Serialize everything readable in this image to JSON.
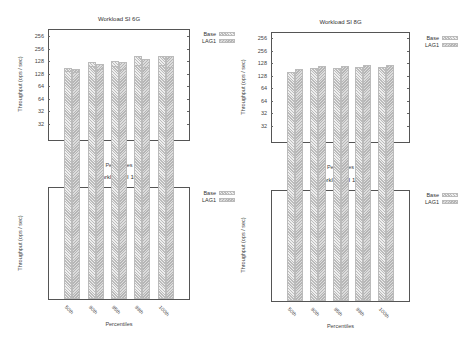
{
  "figure": {
    "ylabel": "Throughput (ops / sec)",
    "xlabel": "Percentiles",
    "legend": [
      "Base",
      "LAG1"
    ],
    "yticks": [
      256,
      128,
      64,
      32
    ],
    "categories": [
      "50th",
      "90th",
      "95th",
      "99th",
      "100th"
    ]
  },
  "chart_data": [
    {
      "type": "bar",
      "title": "Workload SI 6G",
      "xlabel": "Percentiles",
      "ylabel": "Throughput (ops / sec)",
      "yscale": "log2",
      "yticks": [
        32,
        64,
        128,
        256
      ],
      "categories": [
        "50th",
        "90th",
        "95th",
        "99th",
        "100th"
      ],
      "series": [
        {
          "name": "Base",
          "values": [
            151,
            180,
            184,
            210,
            211
          ]
        },
        {
          "name": "LAG1",
          "values": [
            147,
            169,
            179,
            194,
            208
          ]
        }
      ],
      "legend_position": "outside-top-right"
    },
    {
      "type": "bar",
      "title": "Workload SI 8G",
      "xlabel": "Percentiles",
      "ylabel": "Throughput (ops / sec)",
      "yscale": "log2",
      "yticks": [
        32,
        64,
        128,
        256
      ],
      "categories": [
        "50th",
        "90th",
        "95th",
        "99th",
        "100th"
      ],
      "series": [
        {
          "name": "Base",
          "values": [
            112,
            124,
            124,
            135,
            135
          ]
        },
        {
          "name": "LAG1",
          "values": [
            105,
            118,
            121,
            135,
            135
          ]
        }
      ],
      "legend_position": "outside-top-right"
    },
    {
      "type": "bar",
      "title": "Workload SI 10G",
      "xlabel": "Percentiles",
      "ylabel": "Throughput (ops / sec)",
      "yscale": "log2",
      "yticks": [
        32,
        64,
        128,
        256
      ],
      "categories": [
        "50th",
        "90th",
        "95th",
        "99th",
        "100th"
      ],
      "series": [
        {
          "name": "Base",
          "values": [
            97,
            111,
            112,
            114,
            115
          ]
        },
        {
          "name": "LAG1",
          "values": [
            95,
            103,
            102,
            107,
            108
          ]
        }
      ],
      "legend_position": "outside-top-right"
    },
    {
      "type": "bar",
      "title": "Workload SI 12G",
      "xlabel": "Percentiles",
      "ylabel": "Throughput (ops / sec)",
      "yscale": "log2",
      "yticks": [
        32,
        64,
        128,
        256
      ],
      "categories": [
        "50th",
        "90th",
        "95th",
        "99th",
        "100th"
      ],
      "series": [
        {
          "name": "Base",
          "values": [
            100,
            111,
            110,
            115,
            114
          ]
        },
        {
          "name": "LAG1",
          "values": [
            108,
            117,
            118,
            121,
            121
          ]
        }
      ],
      "legend_position": "outside-top-right"
    }
  ],
  "layout": [
    {
      "left": 0,
      "top": 0,
      "title_y": 13,
      "plot": {
        "x": 48,
        "y": 29,
        "w": 142,
        "h": 112
      },
      "tick256_y": 49,
      "px_per_doubling": 25,
      "legend": {
        "x": 190,
        "y": 30
      }
    },
    {
      "left": 235,
      "top": 0,
      "title_y": 18,
      "plot": {
        "x": 36,
        "y": 32,
        "w": 139,
        "h": 111
      },
      "tick256_y": 51,
      "px_per_doubling": 25,
      "legend": {
        "x": 178,
        "y": 34
      }
    },
    {
      "left": 0,
      "top": 173,
      "title_y": 3,
      "plot": {
        "x": 48,
        "y": 14,
        "w": 142,
        "h": 113
      },
      "tick256_y": 36,
      "px_per_doubling": 25,
      "legend": {
        "x": 190,
        "y": 16
      }
    },
    {
      "left": 235,
      "top": 173,
      "title_y": 4,
      "plot": {
        "x": 36,
        "y": 17,
        "w": 139,
        "h": 112
      },
      "tick256_y": 38,
      "px_per_doubling": 25,
      "legend": {
        "x": 178,
        "y": 18
      }
    }
  ]
}
